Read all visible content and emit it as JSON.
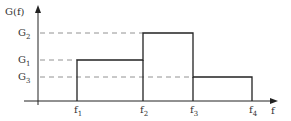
{
  "diagram": {
    "y_axis_label": "G(f)",
    "x_axis_label": "f",
    "y_levels": [
      {
        "name": "G",
        "sub": "2"
      },
      {
        "name": "G",
        "sub": "1"
      },
      {
        "name": "G",
        "sub": "3"
      }
    ],
    "x_ticks": [
      {
        "name": "f",
        "sub": "1"
      },
      {
        "name": "f",
        "sub": "2"
      },
      {
        "name": "f",
        "sub": "3"
      },
      {
        "name": "f",
        "sub": "4"
      }
    ]
  }
}
